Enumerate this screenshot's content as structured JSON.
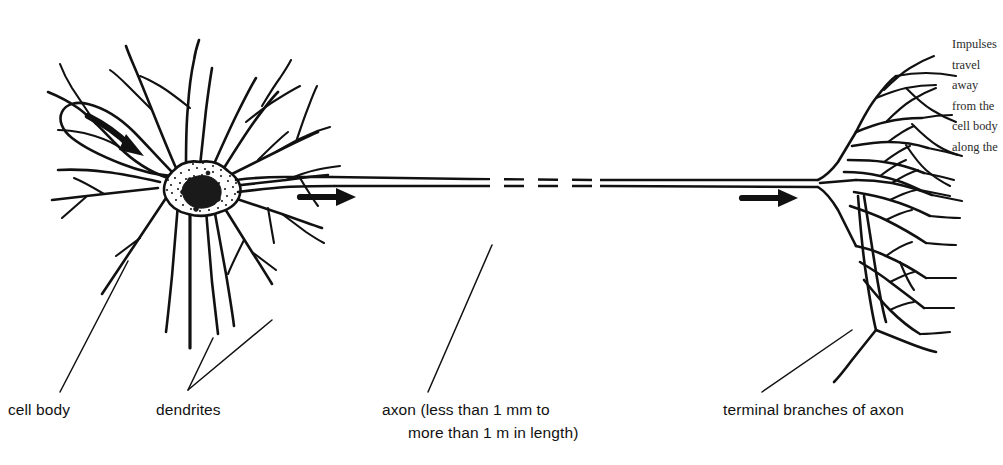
{
  "figure": {
    "background_color": "#ffffff",
    "ink_color": "#111111",
    "width": 968,
    "height": 465
  },
  "labels": {
    "cell_body": "cell body",
    "dendrites": "dendrites",
    "axon_line1": "axon (less than 1 mm to",
    "axon_line2": "more than 1 m in length)",
    "terminal_branches": "terminal branches of axon"
  },
  "parts": {
    "soma_name": "cell-body-soma",
    "nucleus_name": "nucleus",
    "axon_name": "axon",
    "axon_break_name": "axon-break-dashes",
    "dendrite_tree_name": "dendrite-tree",
    "terminal_tree_name": "terminal-branch-tree"
  },
  "arrows": {
    "dendrite_arrow": "curved-arrow-toward-soma",
    "axon_arrow_left": "arrow-right-proximal-axon",
    "axon_arrow_right": "arrow-right-distal-axon",
    "direction": "right"
  },
  "margin_text": {
    "lines": [
      "Impulses",
      "travel",
      "away",
      "from the",
      "cell body",
      "along the",
      "axon."
    ]
  }
}
